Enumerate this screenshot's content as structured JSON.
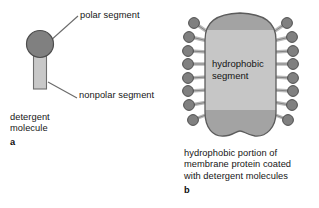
{
  "figure": {
    "panel_a": {
      "letter": "a",
      "labels": {
        "polar_segment": "polar segment",
        "nonpolar_segment": "nonpolar segment",
        "caption": "detergent\nmolecule"
      },
      "molecule": {
        "head_name": "polar-head-group",
        "tail_name": "nonpolar-tail"
      }
    },
    "panel_b": {
      "letter": "b",
      "blob_label": "hydrophobic\nsegment",
      "caption": "hydrophobic portion of\nmembrane protein coated\nwith detergent molecules",
      "detergent_count_left": 8,
      "detergent_count_right": 8
    },
    "colors": {
      "head_fill": "#808080",
      "head_stroke": "#4d4d4d",
      "tail_fill": "#c8c8c8",
      "tail_stroke": "#6e6e6e",
      "blob_band_dark": "#a3a3a3",
      "blob_band_light": "#c6c6c6",
      "blob_stroke": "#5c5c5c",
      "leader_line": "#6b6b6b",
      "background": "#ffffff",
      "text": "#161616"
    }
  }
}
